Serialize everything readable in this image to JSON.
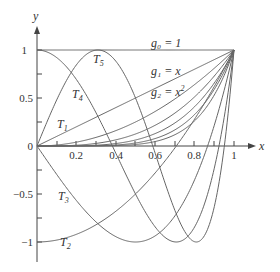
{
  "figure": {
    "axes": {
      "x_label": "x",
      "y_label": "y",
      "x_ticks": [
        "0.2",
        "0.4",
        "0.6",
        "0.8",
        "1"
      ],
      "y_ticks": [
        "1",
        "0.5",
        "0",
        "−0.5",
        "−1"
      ]
    },
    "labels": {
      "g0": "g₀ = 1",
      "g1": "g₁ = x",
      "g2_base": "g₂ = x",
      "g2_exp": "2",
      "T1": "T",
      "T1_sub": "1",
      "T2": "T",
      "T2_sub": "2",
      "T3": "T",
      "T3_sub": "3",
      "T4": "T",
      "T4_sub": "4",
      "T5": "T",
      "T5_sub": "5"
    },
    "monomial_powers": [
      0,
      1,
      2,
      3,
      4,
      5,
      6
    ],
    "chebyshev_degrees": [
      1,
      2,
      3,
      4,
      5
    ],
    "colors": {
      "curve": "#666666",
      "axis": "#444444",
      "text": "#333333"
    }
  }
}
